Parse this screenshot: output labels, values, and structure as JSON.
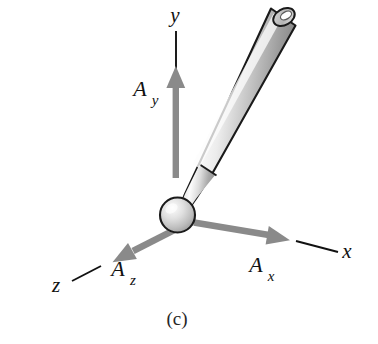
{
  "figure": {
    "caption": "(c)",
    "background_color": "#ffffff",
    "axes": [
      {
        "id": "y",
        "label": "y",
        "label_x": 175,
        "label_y": 22,
        "line_color": "#111111",
        "description": "vertical axis pointing up"
      },
      {
        "id": "x",
        "label": "x",
        "label_x": 347,
        "label_y": 258,
        "line_color": "#111111",
        "description": "axis receding to lower right"
      },
      {
        "id": "z",
        "label": "z",
        "label_x": 56,
        "label_y": 292,
        "line_color": "#111111",
        "description": "axis receding to lower left"
      }
    ],
    "vectors": [
      {
        "id": "Ay",
        "main": "A",
        "subscript": "y",
        "main_x": 140,
        "main_y": 96,
        "sub_x": 155,
        "sub_y": 105,
        "color": "#808080",
        "direction": "up",
        "description": "y component of vector A"
      },
      {
        "id": "Ax",
        "main": "A",
        "subscript": "x",
        "main_x": 256,
        "main_y": 272,
        "sub_x": 271,
        "sub_y": 281,
        "color": "#808080",
        "direction": "lower-right",
        "description": "x component of vector A"
      },
      {
        "id": "Az",
        "main": "A",
        "subscript": "z",
        "main_x": 118,
        "main_y": 276,
        "sub_x": 133,
        "sub_y": 285,
        "color": "#808080",
        "direction": "lower-left",
        "description": "z component of vector A"
      }
    ],
    "object": {
      "name": "baseball-bat",
      "outline_color": "#1a1a1a",
      "body_light": "#fbfbfb",
      "body_mid": "#d3d3d3",
      "body_dark": "#8f8f8f",
      "knob_label": "bat knob sphere at origin",
      "tip_label": "open barrel end ellipse"
    }
  }
}
